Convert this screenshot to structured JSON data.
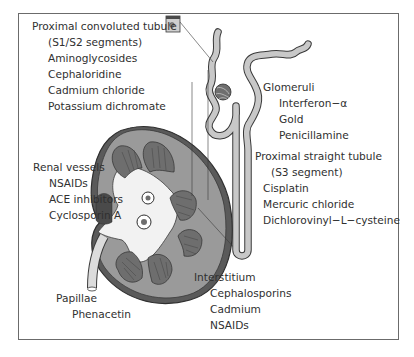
{
  "diagram": {
    "colors": {
      "frame": "#6b6b6b",
      "tubule_fill": "#c8c8c8",
      "cortex_fill": "#9a9a9a",
      "pyramid_fill": "#6e6e6e",
      "pelvis_fill": "#f2f2f2",
      "outline": "#3a3a3a"
    },
    "labels": {
      "pct": {
        "heading": "Proximal convoluted tubule",
        "subheading": "(S1/S2 segments)",
        "items": [
          "Aminoglycosides",
          "Cephaloridine",
          "Cadmium chloride",
          "Potassium dichromate"
        ]
      },
      "glomeruli": {
        "heading": "Glomeruli",
        "items": [
          "Interferon−α",
          "Gold",
          "Penicillamine"
        ]
      },
      "pst": {
        "heading": "Proximal straight tubule",
        "subheading": "(S3 segment)",
        "items": [
          "Cisplatin",
          "Mercuric chloride",
          "Dichlorovinyl−L−cysteine"
        ]
      },
      "renal_vessels": {
        "heading": "Renal vessels",
        "items": [
          "NSAIDs",
          "ACE inhibitors",
          "Cyclosporin A"
        ]
      },
      "papillae": {
        "heading": "Papillae",
        "items": [
          "Phenacetin"
        ]
      },
      "interstitium": {
        "heading": "Interstitium",
        "items": [
          "Cephalosporins",
          "Cadmium",
          "NSAIDs"
        ]
      }
    }
  }
}
